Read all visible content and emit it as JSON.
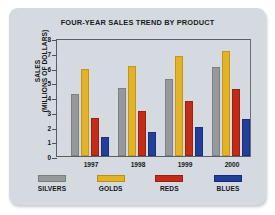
{
  "card": {
    "background_color": "#d5dae0"
  },
  "chart_data": {
    "type": "bar",
    "title": "FOUR-YEAR SALES TREND BY PRODUCT",
    "xlabel": "",
    "ylabel_lines": [
      "SALES",
      "(MILLIONS OF DOLLARS)"
    ],
    "ylabel": "SALES (MILLIONS OF DOLLARS)",
    "ylim": [
      0,
      8
    ],
    "yticks": [
      0,
      1,
      2,
      3,
      4,
      5,
      6,
      7,
      8
    ],
    "ytick_labels": [
      "0",
      "1",
      "2",
      "3",
      "4",
      "5",
      "6",
      "7",
      "8"
    ],
    "grid": false,
    "legend_position": "bottom",
    "categories": [
      "1997",
      "1998",
      "1999",
      "2000"
    ],
    "series": [
      {
        "name": "SILVERS",
        "color": "#96999b",
        "values": [
          4.2,
          4.6,
          5.25,
          6.05
        ]
      },
      {
        "name": "GOLDS",
        "color": "#e2b326",
        "values": [
          5.9,
          6.1,
          6.8,
          7.15
        ]
      },
      {
        "name": "REDS",
        "color": "#c32c17",
        "values": [
          2.6,
          3.05,
          3.7,
          4.55
        ]
      },
      {
        "name": "BLUES",
        "color": "#22409a",
        "values": [
          1.3,
          1.6,
          1.95,
          2.5
        ]
      }
    ]
  }
}
